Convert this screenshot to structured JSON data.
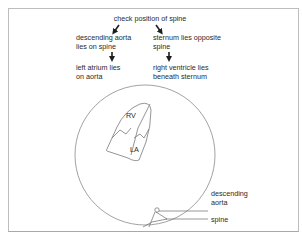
{
  "figure": {
    "top_clipped_text": "",
    "flow": {
      "root": "check position of spine",
      "left_branch": {
        "step1": [
          "descending aorta",
          "lies on spine"
        ],
        "step2": [
          "left atrium lies",
          "on aorta"
        ]
      },
      "right_branch": {
        "step1": [
          "sternum lies opposite",
          "spine"
        ],
        "step2": [
          "right ventricle lies",
          "beneath sternum"
        ]
      }
    },
    "cross_section": {
      "chamber_labels": {
        "rv": "RV",
        "la": "LA"
      },
      "callouts": {
        "aorta": [
          "descending",
          "aorta"
        ],
        "spine": "spine"
      }
    },
    "colors": {
      "text": "#2a2a2a",
      "line": "#8a8a8a",
      "frame": "#bdbdbd",
      "background": "#ffffff"
    }
  }
}
